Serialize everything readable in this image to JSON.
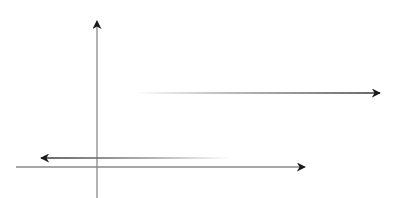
{
  "diagram": {
    "background": "#ffffff",
    "colors": {
      "axis": "#8a8a8a",
      "arrowhead": "#1a1a1a",
      "line_dark": "#4a4a4a",
      "line_fade": "#ffffff"
    },
    "elements": [
      {
        "id": "vertical-axis",
        "x1": 97,
        "y1": 198,
        "x2": 97,
        "y2": 20,
        "head": "end"
      },
      {
        "id": "horizontal-axis",
        "x1": 16,
        "y1": 167,
        "x2": 305,
        "y2": 167,
        "head": "end"
      },
      {
        "id": "left-arrow",
        "x1": 230,
        "y1": 158,
        "x2": 40,
        "y2": 158,
        "head": "end",
        "fade": "start"
      },
      {
        "id": "upper-right-arrow",
        "x1": 135,
        "y1": 93,
        "x2": 381,
        "y2": 93,
        "head": "end",
        "fade": "start"
      }
    ]
  }
}
